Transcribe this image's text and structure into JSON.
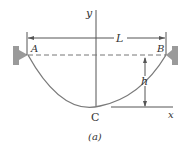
{
  "diagram": {
    "caption": "(a)",
    "labels": {
      "y_axis": "y",
      "x_axis": "x",
      "span": "L",
      "sag": "h",
      "point_a": "A",
      "point_b": "B",
      "point_c": "C"
    },
    "colors": {
      "cable": "#7a7a7a",
      "lines": "#555555",
      "support": "#9a9a9a",
      "text": "#333333"
    }
  }
}
